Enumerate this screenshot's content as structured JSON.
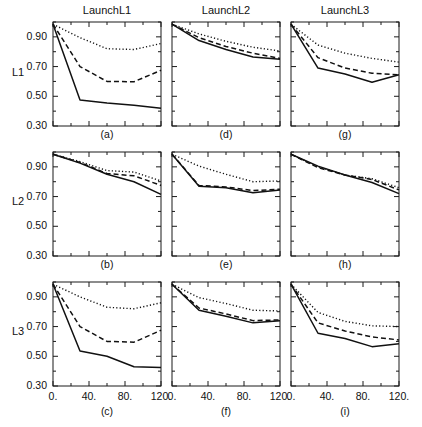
{
  "figure": {
    "columns": [
      {
        "title": "LaunchL1"
      },
      {
        "title": "LaunchL2"
      },
      {
        "title": "LaunchL3"
      }
    ],
    "rows": [
      {
        "label": "L1"
      },
      {
        "label": "L2"
      },
      {
        "label": "L3"
      }
    ],
    "axis": {
      "y_ticklabels": [
        "0.90",
        "0.70",
        "0.50",
        "0.30"
      ],
      "x_ticklabels": [
        "0.",
        "40.",
        "80.",
        "120."
      ]
    }
  },
  "chart_data": [
    {
      "type": "line",
      "panel": "a",
      "title": "LaunchL1",
      "row": "L1",
      "xlabel": "",
      "ylabel": "L1",
      "xlim": [
        0,
        120
      ],
      "ylim": [
        0.3,
        1.0
      ],
      "grid": false,
      "legend": "none",
      "x": [
        0,
        30,
        60,
        90,
        120
      ],
      "series": [
        {
          "name": "dotted",
          "style": "dotted",
          "values": [
            0.985,
            0.895,
            0.82,
            0.815,
            0.855
          ]
        },
        {
          "name": "dashed",
          "style": "dashed",
          "values": [
            0.985,
            0.7,
            0.6,
            0.598,
            0.675
          ]
        },
        {
          "name": "solid",
          "style": "solid",
          "values": [
            0.985,
            0.475,
            0.455,
            0.44,
            0.42
          ]
        }
      ]
    },
    {
      "type": "line",
      "panel": "d",
      "title": "LaunchL2",
      "row": "L1",
      "xlabel": "",
      "ylabel": "",
      "xlim": [
        0,
        120
      ],
      "ylim": [
        0.3,
        1.0
      ],
      "grid": false,
      "legend": "none",
      "x": [
        0,
        30,
        60,
        90,
        120
      ],
      "series": [
        {
          "name": "dotted",
          "style": "dotted",
          "values": [
            0.985,
            0.92,
            0.87,
            0.83,
            0.805
          ]
        },
        {
          "name": "dashed",
          "style": "dashed",
          "values": [
            0.985,
            0.895,
            0.835,
            0.79,
            0.755
          ]
        },
        {
          "name": "solid",
          "style": "solid",
          "values": [
            0.985,
            0.875,
            0.815,
            0.765,
            0.75
          ]
        }
      ]
    },
    {
      "type": "line",
      "panel": "g",
      "title": "LaunchL3",
      "row": "L1",
      "xlabel": "",
      "ylabel": "",
      "xlim": [
        0,
        120
      ],
      "ylim": [
        0.3,
        1.0
      ],
      "grid": false,
      "legend": "none",
      "x": [
        0,
        30,
        60,
        90,
        120
      ],
      "series": [
        {
          "name": "dotted",
          "style": "dotted",
          "values": [
            0.985,
            0.845,
            0.79,
            0.755,
            0.73
          ]
        },
        {
          "name": "dashed",
          "style": "dashed",
          "values": [
            0.985,
            0.76,
            0.69,
            0.655,
            0.645
          ]
        },
        {
          "name": "solid",
          "style": "solid",
          "values": [
            0.985,
            0.69,
            0.65,
            0.595,
            0.645
          ]
        }
      ]
    },
    {
      "type": "line",
      "panel": "b",
      "title": "LaunchL1",
      "row": "L2",
      "xlabel": "",
      "ylabel": "L2",
      "xlim": [
        0,
        120
      ],
      "ylim": [
        0.3,
        1.0
      ],
      "grid": false,
      "legend": "none",
      "x": [
        0,
        30,
        60,
        90,
        120
      ],
      "series": [
        {
          "name": "dotted",
          "style": "dotted",
          "values": [
            0.985,
            0.935,
            0.875,
            0.865,
            0.805
          ]
        },
        {
          "name": "dashed",
          "style": "dashed",
          "values": [
            0.985,
            0.93,
            0.855,
            0.84,
            0.775
          ]
        },
        {
          "name": "solid",
          "style": "solid",
          "values": [
            0.985,
            0.925,
            0.85,
            0.8,
            0.715
          ]
        }
      ]
    },
    {
      "type": "line",
      "panel": "e",
      "title": "LaunchL2",
      "row": "L2",
      "xlabel": "",
      "ylabel": "",
      "xlim": [
        0,
        120
      ],
      "ylim": [
        0.3,
        1.0
      ],
      "grid": false,
      "legend": "none",
      "x": [
        0,
        30,
        60,
        90,
        120
      ],
      "series": [
        {
          "name": "dotted",
          "style": "dotted",
          "values": [
            0.985,
            0.905,
            0.85,
            0.8,
            0.805
          ]
        },
        {
          "name": "dashed",
          "style": "dashed",
          "values": [
            0.985,
            0.775,
            0.765,
            0.74,
            0.75
          ]
        },
        {
          "name": "solid",
          "style": "solid",
          "values": [
            0.985,
            0.77,
            0.76,
            0.725,
            0.745
          ]
        }
      ]
    },
    {
      "type": "line",
      "panel": "h",
      "title": "LaunchL3",
      "row": "L2",
      "xlabel": "",
      "ylabel": "",
      "xlim": [
        0,
        120
      ],
      "ylim": [
        0.3,
        1.0
      ],
      "grid": false,
      "legend": "none",
      "x": [
        0,
        30,
        60,
        90,
        120
      ],
      "series": [
        {
          "name": "dotted",
          "style": "dotted",
          "values": [
            0.985,
            0.9,
            0.845,
            0.82,
            0.76
          ]
        },
        {
          "name": "dashed",
          "style": "dashed",
          "values": [
            0.985,
            0.895,
            0.845,
            0.815,
            0.745
          ]
        },
        {
          "name": "solid",
          "style": "solid",
          "values": [
            0.985,
            0.905,
            0.845,
            0.795,
            0.72
          ]
        }
      ]
    },
    {
      "type": "line",
      "panel": "c",
      "title": "LaunchL1",
      "row": "L3",
      "xlabel": "",
      "ylabel": "L3",
      "xlim": [
        0,
        120
      ],
      "ylim": [
        0.3,
        1.0
      ],
      "grid": false,
      "legend": "none",
      "x": [
        0,
        30,
        60,
        90,
        120
      ],
      "series": [
        {
          "name": "dotted",
          "style": "dotted",
          "values": [
            0.985,
            0.9,
            0.83,
            0.82,
            0.86
          ]
        },
        {
          "name": "dashed",
          "style": "dashed",
          "values": [
            0.985,
            0.7,
            0.6,
            0.595,
            0.675
          ]
        },
        {
          "name": "solid",
          "style": "solid",
          "values": [
            0.985,
            0.535,
            0.5,
            0.43,
            0.425
          ]
        }
      ]
    },
    {
      "type": "line",
      "panel": "f",
      "title": "LaunchL2",
      "row": "L3",
      "xlabel": "",
      "ylabel": "",
      "xlim": [
        0,
        120
      ],
      "ylim": [
        0.3,
        1.0
      ],
      "grid": false,
      "legend": "none",
      "x": [
        0,
        30,
        60,
        90,
        120
      ],
      "series": [
        {
          "name": "dotted",
          "style": "dotted",
          "values": [
            0.985,
            0.895,
            0.855,
            0.81,
            0.805
          ]
        },
        {
          "name": "dashed",
          "style": "dashed",
          "values": [
            0.985,
            0.825,
            0.785,
            0.74,
            0.745
          ]
        },
        {
          "name": "solid",
          "style": "solid",
          "values": [
            0.985,
            0.81,
            0.77,
            0.725,
            0.74
          ]
        }
      ]
    },
    {
      "type": "line",
      "panel": "i",
      "title": "LaunchL3",
      "row": "L3",
      "xlabel": "",
      "ylabel": "",
      "xlim": [
        0,
        120
      ],
      "ylim": [
        0.3,
        1.0
      ],
      "grid": false,
      "legend": "none",
      "x": [
        0,
        30,
        60,
        90,
        120
      ],
      "series": [
        {
          "name": "dotted",
          "style": "dotted",
          "values": [
            0.985,
            0.795,
            0.735,
            0.705,
            0.7
          ]
        },
        {
          "name": "dashed",
          "style": "dashed",
          "values": [
            0.985,
            0.725,
            0.67,
            0.63,
            0.61
          ]
        },
        {
          "name": "solid",
          "style": "solid",
          "values": [
            0.985,
            0.655,
            0.62,
            0.565,
            0.585
          ]
        }
      ]
    }
  ]
}
